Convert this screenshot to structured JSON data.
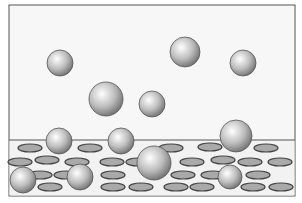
{
  "diagram": {
    "frame": {
      "x": 9,
      "y": 5,
      "width": 286,
      "height": 191,
      "stroke": "#555555",
      "fill": "#f7f7f7"
    },
    "surface": {
      "y": 140,
      "fill": "#f2f2f2",
      "line": "#555555"
    },
    "colors": {
      "sphere_light": "#ffffff",
      "sphere_mid": "#bdbdbd",
      "sphere_dark": "#6e6e6e",
      "hole_fill": "#a9a9a9",
      "hole_rim": "#444444"
    },
    "free_spheres": [
      {
        "cx": 60,
        "cy": 63,
        "r": 13
      },
      {
        "cx": 185,
        "cy": 52,
        "r": 15
      },
      {
        "cx": 243,
        "cy": 63,
        "r": 13
      },
      {
        "cx": 106,
        "cy": 99,
        "r": 17
      },
      {
        "cx": 152,
        "cy": 104,
        "r": 13
      }
    ],
    "adsorbed_spheres": [
      {
        "cx": 59,
        "cy": 141,
        "r": 13
      },
      {
        "cx": 121,
        "cy": 141,
        "r": 13
      },
      {
        "cx": 236,
        "cy": 136,
        "r": 16
      },
      {
        "cx": 154,
        "cy": 163,
        "r": 17
      },
      {
        "cx": 23,
        "cy": 180,
        "r": 13
      },
      {
        "cx": 80,
        "cy": 177,
        "r": 13
      },
      {
        "cx": 230,
        "cy": 177,
        "r": 12
      }
    ],
    "holes": [
      {
        "cx": 30,
        "cy": 148,
        "rx": 12,
        "ry": 4
      },
      {
        "cx": 90,
        "cy": 148,
        "rx": 12,
        "ry": 4
      },
      {
        "cx": 171,
        "cy": 148,
        "rx": 12,
        "ry": 4
      },
      {
        "cx": 210,
        "cy": 147,
        "rx": 12,
        "ry": 4
      },
      {
        "cx": 266,
        "cy": 148,
        "rx": 12,
        "ry": 4
      },
      {
        "cx": 20,
        "cy": 162,
        "rx": 12,
        "ry": 4
      },
      {
        "cx": 47,
        "cy": 160,
        "rx": 12,
        "ry": 4
      },
      {
        "cx": 77,
        "cy": 162,
        "rx": 12,
        "ry": 4
      },
      {
        "cx": 112,
        "cy": 162,
        "rx": 12,
        "ry": 4
      },
      {
        "cx": 138,
        "cy": 162,
        "rx": 12,
        "ry": 4
      },
      {
        "cx": 192,
        "cy": 162,
        "rx": 12,
        "ry": 4
      },
      {
        "cx": 223,
        "cy": 160,
        "rx": 12,
        "ry": 4
      },
      {
        "cx": 250,
        "cy": 162,
        "rx": 12,
        "ry": 4
      },
      {
        "cx": 280,
        "cy": 162,
        "rx": 12,
        "ry": 4
      },
      {
        "cx": 40,
        "cy": 175,
        "rx": 12,
        "ry": 4
      },
      {
        "cx": 66,
        "cy": 175,
        "rx": 12,
        "ry": 4
      },
      {
        "cx": 113,
        "cy": 175,
        "rx": 12,
        "ry": 4
      },
      {
        "cx": 183,
        "cy": 175,
        "rx": 12,
        "ry": 4
      },
      {
        "cx": 213,
        "cy": 175,
        "rx": 12,
        "ry": 4
      },
      {
        "cx": 258,
        "cy": 175,
        "rx": 12,
        "ry": 4
      },
      {
        "cx": 50,
        "cy": 187,
        "rx": 12,
        "ry": 4
      },
      {
        "cx": 113,
        "cy": 187,
        "rx": 12,
        "ry": 4
      },
      {
        "cx": 141,
        "cy": 187,
        "rx": 12,
        "ry": 4
      },
      {
        "cx": 176,
        "cy": 187,
        "rx": 12,
        "ry": 4
      },
      {
        "cx": 202,
        "cy": 187,
        "rx": 12,
        "ry": 4
      },
      {
        "cx": 253,
        "cy": 187,
        "rx": 12,
        "ry": 4
      },
      {
        "cx": 281,
        "cy": 187,
        "rx": 12,
        "ry": 4
      }
    ]
  }
}
